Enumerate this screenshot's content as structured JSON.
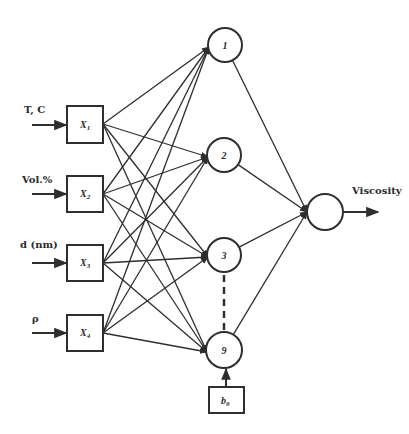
{
  "diagram": {
    "type": "neural-network",
    "inputs": [
      {
        "id": "x1",
        "label": "T, C",
        "symbol": "X",
        "subscript": "1"
      },
      {
        "id": "x2",
        "label": "Vol.%",
        "symbol": "X",
        "subscript": "2"
      },
      {
        "id": "x3",
        "label": "d (nm)",
        "symbol": "X",
        "subscript": "3"
      },
      {
        "id": "x4",
        "label": "ρ",
        "symbol": "X",
        "subscript": "4"
      }
    ],
    "hidden": [
      {
        "id": "h1",
        "label": "1"
      },
      {
        "id": "h2",
        "label": "2"
      },
      {
        "id": "h3",
        "label": "3"
      },
      {
        "id": "h9",
        "label": "9"
      }
    ],
    "ellipsis_between": [
      "h3",
      "h9"
    ],
    "bias": {
      "id": "b9",
      "symbol": "b",
      "subscript": "9",
      "target": "h9"
    },
    "output": {
      "id": "out",
      "label": "Viscosity"
    },
    "edges": "fully-connected inputs→hidden, hidden→output"
  }
}
